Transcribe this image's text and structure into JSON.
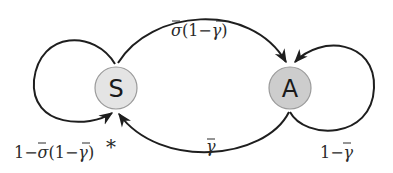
{
  "diagram": {
    "type": "state-transition",
    "nodes": [
      {
        "id": "S",
        "label": "S",
        "fill": "#e4e4e4"
      },
      {
        "id": "A",
        "label": "A",
        "fill": "#cdcdcd"
      }
    ],
    "edges": [
      {
        "from": "S",
        "to": "A",
        "label_prefix": "",
        "label": "σ̄(1−γ̄)"
      },
      {
        "from": "A",
        "to": "S",
        "label": "γ̄"
      },
      {
        "from": "S",
        "to": "S",
        "label": "1−σ̄(1−γ̄)",
        "marker": "*"
      },
      {
        "from": "A",
        "to": "A",
        "label": "1−γ̄"
      }
    ]
  },
  "labels": {
    "s_to_a": {
      "sigma": "σ",
      "open": "(1−",
      "gamma": "γ",
      "close": ")"
    },
    "a_to_s": {
      "gamma": "γ"
    },
    "s_self": {
      "one_minus": "1−",
      "sigma": "σ",
      "open": "(1−",
      "gamma": "γ",
      "close": ")",
      "asterisk": "*"
    },
    "a_self": {
      "one_minus": "1−",
      "gamma": "γ"
    }
  },
  "colors": {
    "edge": "#1e1e1e",
    "node_s_fill": "#e4e4e4",
    "node_a_fill": "#cdcdcd",
    "node_stroke": "#9a9a9a"
  }
}
